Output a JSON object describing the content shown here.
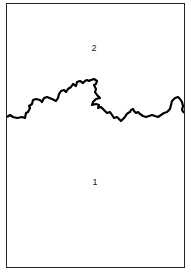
{
  "diagram": {
    "regions": [
      {
        "id": "upper",
        "label": "2"
      },
      {
        "id": "lower",
        "label": "1"
      }
    ],
    "boundary": {
      "description": "irregular jagged boundary line separating region 2 (above) from region 1 (below)",
      "color": "#000000"
    }
  }
}
